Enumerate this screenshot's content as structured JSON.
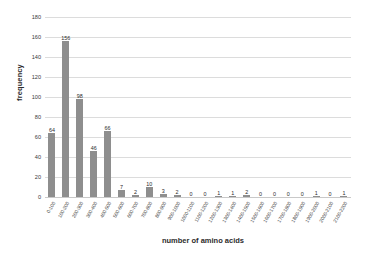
{
  "chart_data": {
    "type": "bar",
    "title": "",
    "xlabel": "number of amino acids",
    "ylabel": "frequency",
    "categories": [
      "0-100",
      "100-200",
      "200-300",
      "300-400",
      "400-500",
      "500-600",
      "600-700",
      "700-800",
      "800-900",
      "900-1000",
      "1000-1100",
      "1100-1200",
      "1200-1300",
      "1300-1400",
      "1400-1500",
      "1500-1600",
      "1600-1700",
      "1700-1800",
      "1800-1900",
      "1900-2000",
      "2000-2100",
      "2100-2200"
    ],
    "values": [
      64,
      156,
      98,
      46,
      66,
      7,
      2,
      10,
      3,
      2,
      0,
      0,
      1,
      1,
      2,
      0,
      0,
      0,
      0,
      1,
      0,
      1
    ],
    "ylim": [
      0,
      180
    ],
    "yticks": [
      0,
      20,
      40,
      60,
      80,
      100,
      120,
      140,
      160,
      180
    ],
    "grid": true,
    "legend": false,
    "bar_color": "#8e8e8e",
    "grid_color": "#dcdcdc"
  }
}
